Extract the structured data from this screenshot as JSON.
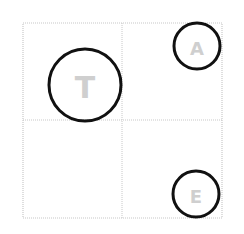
{
  "diagram": {
    "grid": {
      "rows": 2,
      "cols": 2,
      "x": 23,
      "y": 23,
      "width": 199,
      "height": 195,
      "divider_x": 122,
      "divider_y": 120,
      "line_color": "#c8c8c8"
    },
    "nodes": [
      {
        "label": "T",
        "cx": 85,
        "cy": 85,
        "r": 36,
        "font_size": 30
      },
      {
        "label": "A",
        "cx": 197,
        "cy": 46,
        "r": 23,
        "font_size": 18
      },
      {
        "label": "E",
        "cx": 196,
        "cy": 194,
        "r": 23,
        "font_size": 18
      }
    ],
    "circle_color": "#111111",
    "label_color": "#cfcfcf"
  }
}
